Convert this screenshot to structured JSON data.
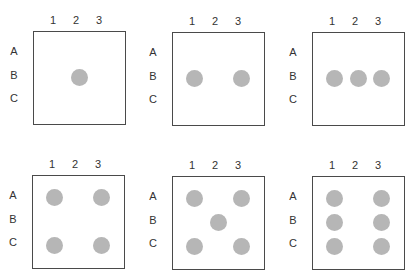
{
  "diagram": {
    "columns": [
      "1",
      "2",
      "3"
    ],
    "rows": [
      "A",
      "B",
      "C"
    ],
    "dot_color": "#b6b6b6",
    "panels": [
      {
        "label": "one",
        "dots": [
          [
            "B",
            "2"
          ]
        ]
      },
      {
        "label": "two",
        "dots": [
          [
            "B",
            "1"
          ],
          [
            "B",
            "3"
          ]
        ]
      },
      {
        "label": "three",
        "dots": [
          [
            "B",
            "1"
          ],
          [
            "B",
            "2"
          ],
          [
            "B",
            "3"
          ]
        ]
      },
      {
        "label": "four",
        "dots": [
          [
            "A",
            "1"
          ],
          [
            "A",
            "3"
          ],
          [
            "C",
            "1"
          ],
          [
            "C",
            "3"
          ]
        ]
      },
      {
        "label": "five",
        "dots": [
          [
            "A",
            "1"
          ],
          [
            "A",
            "3"
          ],
          [
            "B",
            "2"
          ],
          [
            "C",
            "1"
          ],
          [
            "C",
            "3"
          ]
        ]
      },
      {
        "label": "six",
        "dots": [
          [
            "A",
            "1"
          ],
          [
            "A",
            "3"
          ],
          [
            "B",
            "1"
          ],
          [
            "B",
            "3"
          ],
          [
            "C",
            "1"
          ],
          [
            "C",
            "3"
          ]
        ]
      }
    ]
  }
}
